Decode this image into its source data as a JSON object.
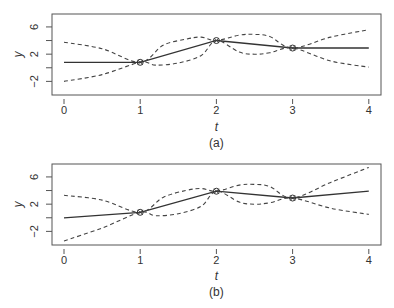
{
  "chart_data": [
    {
      "type": "line",
      "panel": "(a)",
      "caption": "(a)",
      "xlabel": "t",
      "ylabel": "y",
      "xticks": [
        0,
        1,
        2,
        3,
        4
      ],
      "yticks": [
        -2,
        0,
        2,
        4,
        6
      ],
      "ytick_labels": [
        "-2",
        "",
        "2",
        "",
        "6"
      ],
      "xlim": [
        -0.15,
        4.15
      ],
      "ylim": [
        -4,
        7.9
      ],
      "grid": false,
      "points": [
        {
          "t": 1,
          "y": 0.8
        },
        {
          "t": 2,
          "y": 4.0
        },
        {
          "t": 3,
          "y": 2.9
        }
      ],
      "series": [
        {
          "name": "estimate",
          "style": "solid",
          "x": [
            0,
            1,
            2,
            3,
            4
          ],
          "y": [
            0.8,
            0.8,
            4.0,
            2.9,
            2.9
          ]
        },
        {
          "name": "upper bound",
          "style": "dashed",
          "x": [
            0,
            0.5,
            1,
            1.3,
            1.6,
            1.8,
            2,
            2.3,
            2.5,
            2.7,
            3,
            3.5,
            4
          ],
          "y": [
            3.75,
            2.8,
            0.8,
            3.3,
            4.2,
            4.5,
            4.0,
            4.8,
            4.9,
            4.6,
            2.9,
            4.5,
            5.6
          ]
        },
        {
          "name": "lower bound",
          "style": "dashed",
          "x": [
            0,
            0.5,
            1,
            1.2,
            1.5,
            1.8,
            2,
            2.3,
            2.5,
            2.7,
            3,
            3.5,
            4
          ],
          "y": [
            -2.0,
            -1.0,
            0.8,
            0.4,
            0.7,
            1.8,
            4.0,
            2.3,
            2.0,
            2.2,
            2.9,
            1.0,
            0.1
          ]
        }
      ]
    },
    {
      "type": "line",
      "panel": "(b)",
      "caption": "(b)",
      "xlabel": "t",
      "ylabel": "y",
      "xticks": [
        0,
        1,
        2,
        3,
        4
      ],
      "yticks": [
        -2,
        0,
        2,
        4,
        6
      ],
      "ytick_labels": [
        "-2",
        "",
        "2",
        "",
        "6"
      ],
      "xlim": [
        -0.15,
        4.15
      ],
      "ylim": [
        -4,
        7.9
      ],
      "grid": false,
      "points": [
        {
          "t": 1,
          "y": 0.8
        },
        {
          "t": 2,
          "y": 3.9
        },
        {
          "t": 3,
          "y": 2.9
        }
      ],
      "series": [
        {
          "name": "estimate",
          "style": "solid",
          "x": [
            0,
            1,
            2,
            3,
            4
          ],
          "y": [
            0.0,
            0.8,
            3.9,
            2.9,
            3.9
          ]
        },
        {
          "name": "upper bound",
          "style": "dashed",
          "x": [
            0,
            0.5,
            1,
            1.3,
            1.6,
            1.8,
            2,
            2.3,
            2.5,
            2.7,
            3,
            3.5,
            4
          ],
          "y": [
            3.3,
            2.6,
            0.8,
            3.0,
            4.0,
            4.3,
            3.9,
            4.8,
            4.9,
            4.6,
            2.9,
            5.2,
            7.4
          ]
        },
        {
          "name": "lower bound",
          "style": "dashed",
          "x": [
            0,
            0.5,
            1,
            1.2,
            1.5,
            1.8,
            2,
            2.3,
            2.5,
            2.7,
            3,
            3.5,
            4
          ],
          "y": [
            -3.4,
            -1.5,
            0.8,
            0.3,
            0.6,
            1.7,
            3.9,
            2.3,
            2.0,
            2.2,
            2.9,
            1.4,
            0.5
          ]
        }
      ]
    }
  ],
  "layout": {
    "panels": [
      {
        "box": {
          "left": 52,
          "top": 14,
          "right": 381,
          "bottom": 95
        },
        "tick_label_y": 114,
        "xlabel_y": 131,
        "caption_y": 147
      },
      {
        "box": {
          "left": 52,
          "top": 164,
          "right": 381,
          "bottom": 245
        },
        "tick_label_y": 264,
        "xlabel_y": 280,
        "caption_y": 296
      }
    ],
    "x0_px": 64,
    "x_px_per_unit": 76.2,
    "y_px_per_unit": 6.85,
    "line_color": "#333333",
    "dash_color": "#444444"
  }
}
